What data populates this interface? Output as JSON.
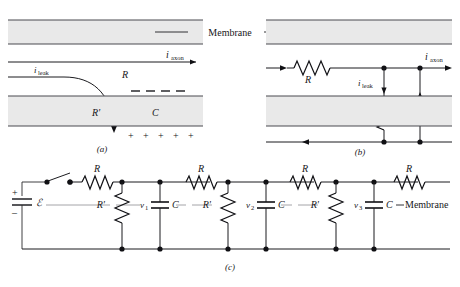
{
  "figure": {
    "caption_a": "(a)",
    "caption_b": "(b)",
    "caption_c": "(c)",
    "membrane_label": "Membrane"
  },
  "panel_a": {
    "id": "(a)",
    "membrane_label": "Membrane",
    "current_axon": "i",
    "current_axon_sub": "axon",
    "current_leak": "i",
    "current_leak_sub": "leak",
    "resistor_axial": "R",
    "resistor_membrane": "R'",
    "capacitor": "C",
    "negative_charges": "–  –  –  –",
    "positive_charges": "+   +   +   +   +",
    "charge_minus": "–",
    "charge_plus": "+"
  },
  "panel_b": {
    "id": "(b)",
    "current_axon": "i",
    "current_axon_sub": "axon",
    "current_leak": "i",
    "current_leak_sub": "leak",
    "resistor_axial": "R",
    "resistor_membrane": "R'",
    "capacitor": "C",
    "cap_plate_top_sign": "–",
    "cap_plate_bottom_sign": "+"
  },
  "panel_c": {
    "id": "(c)",
    "emf_label": "ℰ",
    "battery_plus": "+",
    "battery_minus": "–",
    "membrane_label": "Membrane",
    "resistors_axial": [
      "R",
      "R",
      "R",
      "R"
    ],
    "resistors_membrane": [
      "R'",
      "R'",
      "R'"
    ],
    "capacitors": [
      "C",
      "C",
      "C"
    ],
    "node_voltages": [
      {
        "symbol": "v",
        "sub": "1"
      },
      {
        "symbol": "v",
        "sub": "2"
      },
      {
        "symbol": "v",
        "sub": "3"
      }
    ]
  },
  "colors": {
    "ink": "#17171a",
    "membrane_fill": "#e9e9e9",
    "membrane_edge": "#4a4a50",
    "wire": "#1b1b1f",
    "dash_leader": "#9a9a9e"
  }
}
